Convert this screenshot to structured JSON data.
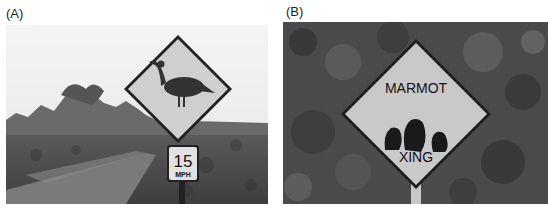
{
  "figure": {
    "panels": [
      {
        "label": "(A)",
        "description": "Road sign with a goose (nene) silhouette on a diamond warning sign beside a dirt road, with a speed limit plate",
        "sign": {
          "shape": "diamond",
          "symbol": "goose-icon",
          "speed_plate": {
            "number": "15",
            "unit": "MPH"
          }
        }
      },
      {
        "label": "(B)",
        "description": "Diamond wildlife crossing sign in front of dense vegetation showing three marmot silhouettes",
        "sign": {
          "shape": "diamond",
          "top_text": "MARMOT",
          "bottom_text": "XING",
          "symbol": "marmot-icon"
        }
      }
    ]
  }
}
